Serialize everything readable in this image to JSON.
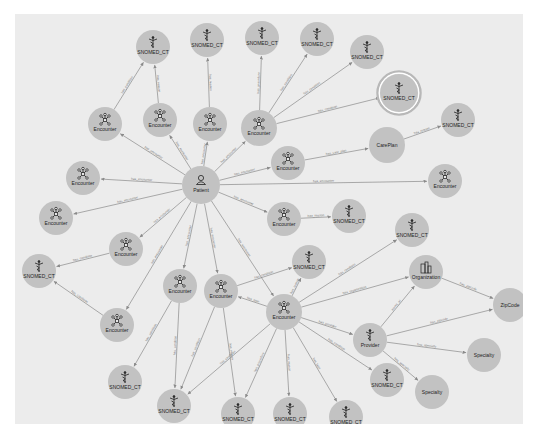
{
  "graph": {
    "background": "#ececec",
    "node_color": "#c2c2c2",
    "edge_color": "#8a8a8a",
    "selected_ring_color": "#b8b8b8",
    "nodes": [
      {
        "id": "patient",
        "label": "Patient",
        "type": "patient",
        "x": 201,
        "y": 185,
        "r": 19
      },
      {
        "id": "s1",
        "label": "SNOMED_CT",
        "type": "snomed",
        "x": 153,
        "y": 47,
        "r": 17
      },
      {
        "id": "s2",
        "label": "SNOMED_CT",
        "type": "snomed",
        "x": 207,
        "y": 40,
        "r": 17
      },
      {
        "id": "s3",
        "label": "SNOMED_CT",
        "type": "snomed",
        "x": 262,
        "y": 38,
        "r": 17
      },
      {
        "id": "s4",
        "label": "SNOMED_CT",
        "type": "snomed",
        "x": 317,
        "y": 39,
        "r": 17
      },
      {
        "id": "s5",
        "label": "SNOMED_CT",
        "type": "snomed",
        "x": 367,
        "y": 52,
        "r": 17
      },
      {
        "id": "s6",
        "label": "SNOMED_CT",
        "type": "snomed",
        "x": 399,
        "y": 93,
        "r": 19,
        "selected": true
      },
      {
        "id": "s7",
        "label": "SNOMED_CT",
        "type": "snomed",
        "x": 458,
        "y": 120,
        "r": 17
      },
      {
        "id": "e1",
        "label": "Encounter",
        "type": "encounter",
        "x": 105,
        "y": 124,
        "r": 17
      },
      {
        "id": "e2",
        "label": "Encounter",
        "type": "encounter",
        "x": 160,
        "y": 120,
        "r": 17
      },
      {
        "id": "e3",
        "label": "Encounter",
        "type": "encounter",
        "x": 210,
        "y": 124,
        "r": 17
      },
      {
        "id": "e4",
        "label": "Encounter",
        "type": "encounter",
        "x": 259,
        "y": 128,
        "r": 18
      },
      {
        "id": "e5",
        "label": "Encounter",
        "type": "encounter",
        "x": 83,
        "y": 178,
        "r": 17
      },
      {
        "id": "e6",
        "label": "Encounter",
        "type": "encounter",
        "x": 56,
        "y": 218,
        "r": 17
      },
      {
        "id": "e7",
        "label": "Encounter",
        "type": "encounter",
        "x": 288,
        "y": 163,
        "r": 17
      },
      {
        "id": "careplan",
        "label": "CarePlan",
        "type": "careplan",
        "x": 387,
        "y": 145,
        "r": 18
      },
      {
        "id": "e8",
        "label": "Encounter",
        "type": "encounter",
        "x": 445,
        "y": 181,
        "r": 17
      },
      {
        "id": "e9",
        "label": "Encounter",
        "type": "encounter",
        "x": 284,
        "y": 219,
        "r": 17
      },
      {
        "id": "s8",
        "label": "SNOMED_CT",
        "type": "snomed",
        "x": 349,
        "y": 216,
        "r": 17
      },
      {
        "id": "e10",
        "label": "Encounter",
        "type": "encounter",
        "x": 126,
        "y": 249,
        "r": 17
      },
      {
        "id": "s9",
        "label": "SNOMED_CT",
        "type": "snomed",
        "x": 412,
        "y": 230,
        "r": 17
      },
      {
        "id": "s10",
        "label": "SNOMED_CT",
        "type": "snomed",
        "x": 309,
        "y": 262,
        "r": 17
      },
      {
        "id": "s11",
        "label": "SNOMED_CT",
        "type": "snomed",
        "x": 39,
        "y": 271,
        "r": 17
      },
      {
        "id": "e11",
        "label": "Encounter",
        "type": "encounter",
        "x": 180,
        "y": 286,
        "r": 17
      },
      {
        "id": "e12",
        "label": "Encounter",
        "type": "encounter",
        "x": 221,
        "y": 291,
        "r": 17
      },
      {
        "id": "org",
        "label": "Organization",
        "type": "organization",
        "x": 426,
        "y": 272,
        "r": 17
      },
      {
        "id": "e13",
        "label": "Encounter",
        "type": "encounter",
        "x": 284,
        "y": 312,
        "r": 18
      },
      {
        "id": "zip",
        "label": "ZipCode",
        "type": "plain",
        "x": 510,
        "y": 305,
        "r": 17
      },
      {
        "id": "e14",
        "label": "Encounter",
        "type": "encounter",
        "x": 117,
        "y": 325,
        "r": 17
      },
      {
        "id": "provider",
        "label": "Provider",
        "type": "provider",
        "x": 370,
        "y": 340,
        "r": 17
      },
      {
        "id": "spec1",
        "label": "Specialty",
        "type": "plain",
        "x": 484,
        "y": 355,
        "r": 17
      },
      {
        "id": "s12",
        "label": "SNOMED_CT",
        "type": "snomed",
        "x": 125,
        "y": 382,
        "r": 17
      },
      {
        "id": "s13",
        "label": "SNOMED_CT",
        "type": "snomed",
        "x": 387,
        "y": 380,
        "r": 17
      },
      {
        "id": "spec2",
        "label": "Specialty",
        "type": "plain",
        "x": 432,
        "y": 392,
        "r": 17
      },
      {
        "id": "s14",
        "label": "SNOMED_CT",
        "type": "snomed",
        "x": 174,
        "y": 406,
        "r": 17
      },
      {
        "id": "s15",
        "label": "SNOMED_CT",
        "type": "snomed",
        "x": 238,
        "y": 414,
        "r": 17
      },
      {
        "id": "s16",
        "label": "SNOMED_CT",
        "type": "snomed",
        "x": 290,
        "y": 414,
        "r": 17
      },
      {
        "id": "s17",
        "label": "SNOMED_CT",
        "type": "snomed",
        "x": 346,
        "y": 417,
        "r": 17
      }
    ],
    "edges": [
      {
        "from": "patient",
        "to": "e1",
        "label": "has_encounter"
      },
      {
        "from": "patient",
        "to": "e2",
        "label": "has_encounter"
      },
      {
        "from": "patient",
        "to": "e3",
        "label": "has_encounter"
      },
      {
        "from": "patient",
        "to": "e4",
        "label": "has_encounter"
      },
      {
        "from": "patient",
        "to": "e5",
        "label": "has_encounter"
      },
      {
        "from": "patient",
        "to": "e6",
        "label": "has_encounter"
      },
      {
        "from": "patient",
        "to": "e7",
        "label": "has_encounter"
      },
      {
        "from": "patient",
        "to": "e8",
        "label": "has_encounter"
      },
      {
        "from": "patient",
        "to": "e9",
        "label": "has_encounter"
      },
      {
        "from": "patient",
        "to": "e10",
        "label": "has_encounter"
      },
      {
        "from": "patient",
        "to": "e11",
        "label": "has_encounter"
      },
      {
        "from": "patient",
        "to": "e12",
        "label": "has_encounter"
      },
      {
        "from": "patient",
        "to": "e13",
        "label": "has_encounter"
      },
      {
        "from": "patient",
        "to": "e14",
        "label": "has_encounter"
      },
      {
        "from": "e1",
        "to": "s1",
        "label": "has_condition"
      },
      {
        "from": "e2",
        "to": "s1",
        "label": "has_reason"
      },
      {
        "from": "e3",
        "to": "s2",
        "label": "has_reason"
      },
      {
        "from": "e4",
        "to": "s3",
        "label": "has_procedure"
      },
      {
        "from": "e4",
        "to": "s4",
        "label": "has_condition"
      },
      {
        "from": "e4",
        "to": "s5",
        "label": "has_condition"
      },
      {
        "from": "e4",
        "to": "s6",
        "label": "has_condition"
      },
      {
        "from": "e7",
        "to": "careplan",
        "label": "has_care_plan"
      },
      {
        "from": "careplan",
        "to": "s7",
        "label": "has_reason"
      },
      {
        "from": "e9",
        "to": "s8",
        "label": "has_reason"
      },
      {
        "from": "e10",
        "to": "s11",
        "label": "has_condition"
      },
      {
        "from": "e14",
        "to": "s11",
        "label": "has_condition"
      },
      {
        "from": "e11",
        "to": "s12",
        "label": "has_condition"
      },
      {
        "from": "e11",
        "to": "s14",
        "label": "has_condition"
      },
      {
        "from": "e12",
        "to": "s14",
        "label": "has_condition"
      },
      {
        "from": "e12",
        "to": "s15",
        "label": "has_reason"
      },
      {
        "from": "e12",
        "to": "s10",
        "label": "has_condition"
      },
      {
        "from": "e13",
        "to": "e12",
        "label": "has_type"
      },
      {
        "from": "e13",
        "to": "s10",
        "label": "has_reason"
      },
      {
        "from": "e13",
        "to": "s9",
        "label": "has_condition"
      },
      {
        "from": "e13",
        "to": "org",
        "label": "has_organization"
      },
      {
        "from": "e13",
        "to": "provider",
        "label": "has_provider"
      },
      {
        "from": "e13",
        "to": "s13",
        "label": "has_condition"
      },
      {
        "from": "e13",
        "to": "s14",
        "label": "has_condition"
      },
      {
        "from": "e13",
        "to": "s15",
        "label": "has_procedure"
      },
      {
        "from": "e13",
        "to": "s16",
        "label": "has_reason"
      },
      {
        "from": "e13",
        "to": "s17",
        "label": "has_type"
      },
      {
        "from": "provider",
        "to": "org",
        "label": "works_at"
      },
      {
        "from": "provider",
        "to": "zip",
        "label": "has_zipcode"
      },
      {
        "from": "provider",
        "to": "spec1",
        "label": "has_specialty"
      },
      {
        "from": "provider",
        "to": "spec2",
        "label": "has_specialty"
      },
      {
        "from": "org",
        "to": "zip",
        "label": "has_zipcode"
      }
    ]
  }
}
